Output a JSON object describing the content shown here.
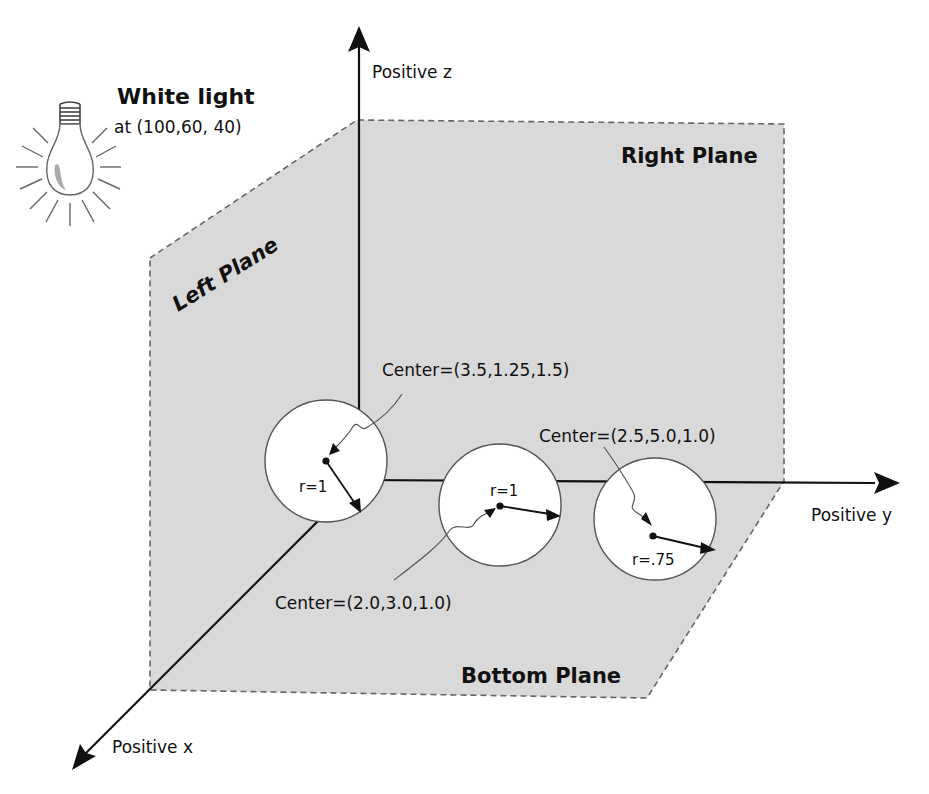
{
  "light": {
    "title": "White light",
    "position": "at (100,60, 40)",
    "icon": "light-bulb-icon"
  },
  "axes": {
    "z_label": "Positive z",
    "y_label": "Positive y",
    "x_label": "Positive x"
  },
  "planes": {
    "left": "Left Plane",
    "right": "Right Plane",
    "bottom": "Bottom Plane",
    "fill_color": "#d9d9d9",
    "edge_color": "#666666"
  },
  "spheres": [
    {
      "center_label": "Center=(3.5,1.25,1.5)",
      "radius_label": "r=1"
    },
    {
      "center_label": "Center=(2.0,3.0,1.0)",
      "radius_label": "r=1"
    },
    {
      "center_label": "Center=(2.5,5.0,1.0)",
      "radius_label": "r=.75"
    }
  ]
}
